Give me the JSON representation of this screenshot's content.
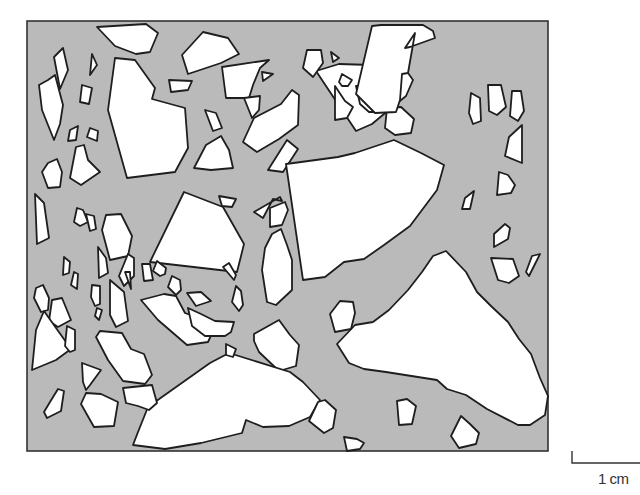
{
  "figure": {
    "colors": {
      "matrix": "#bababa",
      "aggregate": "#ffffff",
      "outline": "#1e1e1e",
      "background": "#ffffff"
    },
    "frame": {
      "x": 27,
      "y": 21,
      "width": 521,
      "height": 430
    }
  },
  "scale_bar": {
    "label": "1 cm"
  },
  "aggregates": [
    "97,27 146,24 158,33 150,52 136,54 115,46",
    "115,58 135,60 155,88 152,99 185,108 188,148 175,172 127,178 108,110",
    "63,48 68,70 60,89 54,57",
    "92,54 97,65 90,75",
    "48,80 55,75 63,105 60,124 54,140 42,110 39,85",
    "82,85 92,88 89,104 80,102",
    "70,130 78,126 76,140 68,141",
    "90,128 98,131 97,141 87,137",
    "76,147 84,145 88,160 100,172 81,185 70,178",
    "48,163 57,159 62,172 60,187 48,188 42,172",
    "203,32 228,38 239,54 221,63 188,74 182,55",
    "222,67 269,60 260,68 253,85 249,98 226,98",
    "262,72 273,74 263,81",
    "169,80 192,81 188,90 171,92",
    "244,98 260,96 259,110 252,118",
    "205,110 216,113 222,128 213,131",
    "254,118 281,104 292,90 299,95 298,125 279,139 257,152 243,142",
    "206,145 221,136 229,150 233,168 211,170 194,168",
    "287,140 298,149 283,172 268,170",
    "291,176 295,180 294,193 290,190",
    "254,212 263,218 273,199 282,201 280,197",
    "184,192 223,207 244,244 237,272 150,262",
    "219,196 236,199 232,207 222,206",
    "35,194 44,203 49,238 37,244",
    "77,208 83,210 88,222 80,226 74,222",
    "86,214 94,216 96,229 90,231",
    "106,215 121,214 132,236 128,256 110,260 102,230",
    "270,208 285,202 288,210 282,225 270,227",
    "272,234 281,229 287,245 292,260 292,290 276,305 267,302 262,270 265,248",
    "286,164 301,162 338,157 355,153 394,140 421,153 444,165 437,190 410,226 384,245 364,259 344,262 325,277 303,280",
    "316,71 339,64 403,66 413,80 406,96 390,109 372,124 356,131",
    "331,52 339,58 333,62",
    "307,50 321,50 323,63 313,77 303,68",
    "342,74 352,80 348,86 342,86 339,82",
    "356,86 396,89 393,103 381,112 369,112 360,104",
    "387,108 401,107 414,119 411,133 395,135 385,128",
    "335,86 345,101 353,107 347,118 335,120",
    "372,26 381,25 423,25 433,31 435,38 410,47 405,48 415,33 408,73 402,74 400,100 396,112 375,113 356,94",
    "471,93 480,98 481,121 473,124 469,113",
    "488,85 501,85 506,107 497,115 489,111",
    "512,91 521,91 524,111 518,121 510,116",
    "522,125 522,163 505,156 509,137",
    "499,172 508,175 515,185 511,193 497,195",
    "465,198 474,191 470,209 462,209",
    "505,224 510,228 508,239 494,247 494,234",
    "491,258 513,259 519,276 509,283 498,280",
    "532,256 540,254 529,276 526,272",
    "355,325 373,322 389,310 408,290 422,272 433,256 446,251 466,272 477,292 491,306 508,322 519,339 531,354 540,378 548,396 545,415 530,425 518,425 487,409 466,395 447,389 437,380 386,372 364,369 349,363 337,344",
    "340,301 353,302 355,313 351,329 335,332 330,314",
    "254,334 279,320 290,335 299,345 296,366 279,371 259,352 254,341",
    "210,363 229,353 290,372 303,382 320,400 310,417 289,426 263,427 246,420 242,433 201,443 165,449 133,445 138,432 148,407 162,397",
    "318,402 325,400 336,410 333,428 324,433 309,421",
    "397,401 407,399 416,406 412,424 399,425",
    "461,416 470,424 479,433 476,444 459,448 451,436",
    "344,437 357,439 364,443 360,449 347,451",
    "36,288 43,285 49,298 48,310 41,312 34,298",
    "52,300 62,298 71,320 58,327 49,321",
    "64,257 70,262 69,273 63,275",
    "74,272 78,274 77,289 71,285",
    "98,247 106,258 108,273 99,278",
    "92,285 100,286 100,304 95,306 91,297",
    "97,308 102,310 99,320 95,316",
    "128,254 134,258 134,276 124,286 119,276",
    "110,280 124,292 128,321 116,327 110,315",
    "125,272 130,272 131,289",
    "142,264 150,264 153,280 144,281",
    "157,261 166,268 165,274 160,276 153,271",
    "172,276 180,280 181,290 176,295 168,287",
    "187,293 201,292 211,301 196,306",
    "44,311 61,335 71,349 56,360 32,370 36,330",
    "67,326 75,330 75,350 70,352 65,346",
    "164,294 176,296 185,313 199,318 214,329 208,342 187,345 158,320 141,300",
    "188,308 201,314 215,321 234,322 231,332 225,336 205,336 192,326",
    "226,344 236,349 233,357 226,355",
    "100,331 122,333 131,349 144,354 152,375 145,384 123,381 108,360 96,337",
    "123,388 152,385 157,403 149,410 138,406 126,403",
    "82,363 101,370 90,385 86,390 83,382",
    "86,393 101,394 118,402 114,426 94,427 81,404",
    "58,389 64,391 61,411 47,418 44,412 50,402",
    "236,286 241,291 243,305 239,311 232,302",
    "223,267 229,263 236,275 234,280"
  ]
}
